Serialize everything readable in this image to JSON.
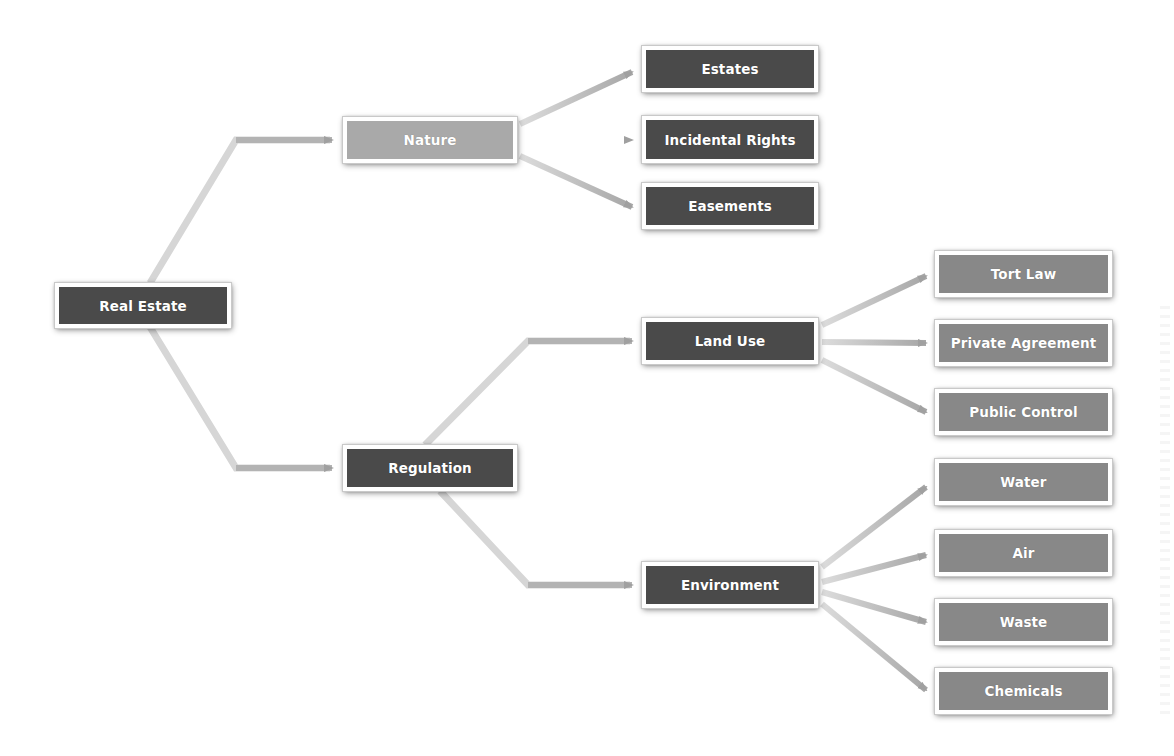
{
  "diagram": {
    "title": "",
    "colors": {
      "dark_node": "#4a4a4a",
      "light_node": "#a9a9a9",
      "mid_node": "#888888",
      "connector": "#b5b5b5",
      "node_border": "#ffffff"
    },
    "nodes": {
      "real_estate": {
        "label": "Real Estate",
        "level": 0,
        "style": "dark"
      },
      "nature": {
        "label": "Nature",
        "level": 1,
        "style": "light",
        "parent": "Real Estate"
      },
      "regulation": {
        "label": "Regulation",
        "level": 1,
        "style": "dark",
        "parent": "Real Estate"
      },
      "estates": {
        "label": "Estates",
        "level": 2,
        "style": "dark",
        "parent": "Nature"
      },
      "incidental_rights": {
        "label": "Incidental Rights",
        "level": 2,
        "style": "dark",
        "parent": "Nature"
      },
      "easements": {
        "label": "Easements",
        "level": 2,
        "style": "dark",
        "parent": "Nature"
      },
      "land_use": {
        "label": "Land Use",
        "level": 2,
        "style": "dark",
        "parent": "Regulation"
      },
      "environment": {
        "label": "Environment",
        "level": 2,
        "style": "dark",
        "parent": "Regulation"
      },
      "tort_law": {
        "label": "Tort Law",
        "level": 3,
        "style": "mid",
        "parent": "Land Use"
      },
      "private_agreement": {
        "label": "Private Agreement",
        "level": 3,
        "style": "mid",
        "parent": "Land Use"
      },
      "public_control": {
        "label": "Public Control",
        "level": 3,
        "style": "mid",
        "parent": "Land Use"
      },
      "water": {
        "label": "Water",
        "level": 3,
        "style": "mid",
        "parent": "Environment"
      },
      "air": {
        "label": "Air",
        "level": 3,
        "style": "mid",
        "parent": "Environment"
      },
      "waste": {
        "label": "Waste",
        "level": 3,
        "style": "mid",
        "parent": "Environment"
      },
      "chemicals": {
        "label": "Chemicals",
        "level": 3,
        "style": "mid",
        "parent": "Environment"
      }
    },
    "edges": [
      [
        "Real Estate",
        "Nature"
      ],
      [
        "Real Estate",
        "Regulation"
      ],
      [
        "Nature",
        "Estates"
      ],
      [
        "Nature",
        "Incidental Rights"
      ],
      [
        "Nature",
        "Easements"
      ],
      [
        "Regulation",
        "Land Use"
      ],
      [
        "Regulation",
        "Environment"
      ],
      [
        "Land Use",
        "Tort Law"
      ],
      [
        "Land Use",
        "Private Agreement"
      ],
      [
        "Land Use",
        "Public Control"
      ],
      [
        "Environment",
        "Water"
      ],
      [
        "Environment",
        "Air"
      ],
      [
        "Environment",
        "Waste"
      ],
      [
        "Environment",
        "Chemicals"
      ]
    ]
  }
}
